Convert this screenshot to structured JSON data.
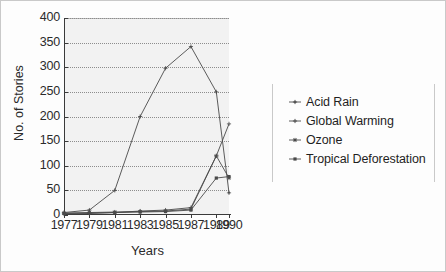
{
  "chart_data": {
    "type": "line",
    "title": "",
    "xlabel": "Years",
    "ylabel": "No. of Stories",
    "x": [
      1977,
      1979,
      1981,
      1983,
      1985,
      1987,
      1989,
      1990
    ],
    "categories": [
      "1977",
      "1979",
      "1981",
      "1983",
      "1985",
      "1987",
      "1989",
      "1990"
    ],
    "xtick_labels": [
      "1977",
      "1979",
      "1981",
      "1983",
      "1985",
      "1987",
      "1989",
      "1990"
    ],
    "ytick_labels": [
      "0",
      "50",
      "100",
      "150",
      "200",
      "250",
      "300",
      "350",
      "400"
    ],
    "ytick_values": [
      0,
      50,
      100,
      150,
      200,
      250,
      300,
      350,
      400
    ],
    "ylim": [
      0,
      400
    ],
    "grid": "horizontal-dotted",
    "legend_position": "right",
    "series": [
      {
        "name": "Acid Rain",
        "marker": "plus-dot",
        "values": [
          5,
          10,
          50,
          200,
          298,
          342,
          250,
          45
        ]
      },
      {
        "name": "Global Warming",
        "marker": "plus",
        "values": [
          2,
          3,
          5,
          8,
          10,
          15,
          120,
          185
        ]
      },
      {
        "name": "Ozone",
        "marker": "asterisk",
        "values": [
          4,
          5,
          6,
          7,
          8,
          12,
          120,
          75
        ]
      },
      {
        "name": "Tropical Deforestation",
        "marker": "filled-square",
        "values": [
          3,
          4,
          5,
          6,
          7,
          10,
          75,
          78
        ]
      }
    ]
  },
  "legend": {
    "items": [
      {
        "label": "Acid Rain",
        "marker": "plus-dot"
      },
      {
        "label": "Global Warming",
        "marker": "plus"
      },
      {
        "label": "Ozone",
        "marker": "asterisk"
      },
      {
        "label": "Tropical Deforestation",
        "marker": "filled-square"
      }
    ]
  },
  "colors": {
    "line": "#4a4a4a",
    "grid": "#8d8d8d",
    "axis": "#3a3a3a",
    "plot_background": "#f2f2f2",
    "figure_background": "#fdfdfd",
    "text": "#1f1f1f"
  }
}
